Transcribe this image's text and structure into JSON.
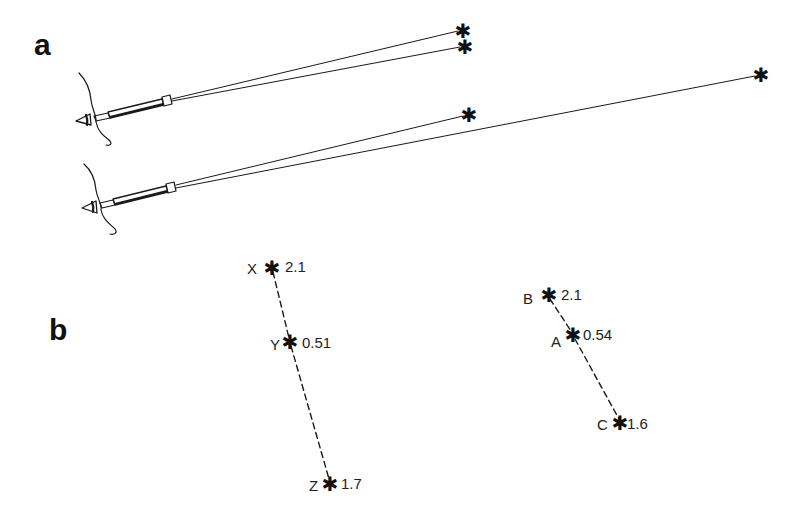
{
  "panels": {
    "a": {
      "label": "a"
    },
    "b": {
      "label": "b"
    }
  },
  "panel_a": {
    "description": "Two observers looking through telescopes at pairs of stars",
    "telescopes": [
      {
        "id": "upper",
        "targets": [
          "star-1",
          "star-2"
        ]
      },
      {
        "id": "lower",
        "targets": [
          "star-3",
          "star-4"
        ]
      }
    ],
    "star_glyph": "✱"
  },
  "panel_b": {
    "groups": [
      {
        "id": "left",
        "points": [
          {
            "name": "X",
            "value": "2.1"
          },
          {
            "name": "Y",
            "value": "0.51"
          },
          {
            "name": "Z",
            "value": "1.7"
          }
        ]
      },
      {
        "id": "right",
        "points": [
          {
            "name": "B",
            "value": "2.1"
          },
          {
            "name": "A",
            "value": "0.54"
          },
          {
            "name": "C",
            "value": "1.6"
          }
        ]
      }
    ]
  },
  "colors": {
    "ink": "#1a1a1a",
    "background": "#ffffff"
  }
}
